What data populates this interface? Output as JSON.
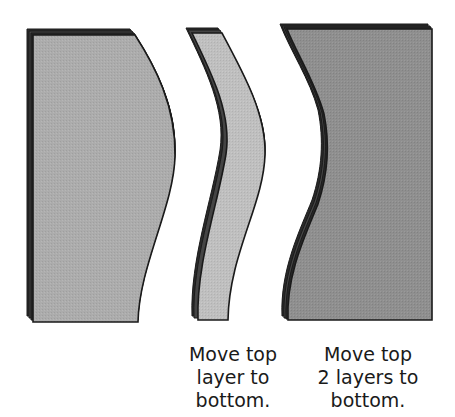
{
  "diagram": {
    "colors": {
      "left_fill": "#a9a9a9",
      "middle_fill": "#bdbdbd",
      "right_fill": "#8e8e8e",
      "outline": "#1a1a1a",
      "layer_edge": "#3a3a3a"
    },
    "panels": [
      {
        "id": "left",
        "label": "Original stacked layers with convex right edge"
      },
      {
        "id": "middle",
        "label": "Curved strip cut from stack"
      },
      {
        "id": "right",
        "label": "Remaining stack with concave left edge"
      }
    ],
    "captions": {
      "middle": {
        "line1": "Move top",
        "line2": "layer to",
        "line3": "bottom."
      },
      "right": {
        "line1": "Move top",
        "line2": "2 layers to",
        "line3": "bottom."
      }
    }
  }
}
